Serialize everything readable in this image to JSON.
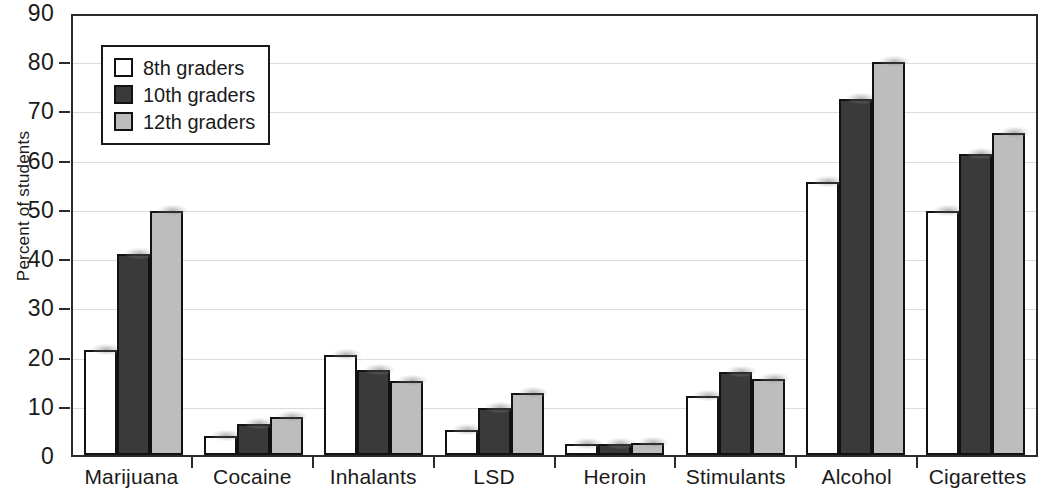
{
  "chart_data": {
    "type": "bar",
    "title": "",
    "subtitle": "",
    "xlabel": "",
    "ylabel": "Percent of students",
    "ylim": [
      0,
      90
    ],
    "ytick_step": 10,
    "yticks": [
      90,
      80,
      70,
      60,
      50,
      40,
      30,
      20,
      10,
      0
    ],
    "grid": true,
    "legend_position": "top-left",
    "categories": [
      "Marijuana",
      "Cocaine",
      "Inhalants",
      "LSD",
      "Heroin",
      "Stimulants",
      "Alcohol",
      "Cigarettes"
    ],
    "series": [
      {
        "name": "8th graders",
        "color": "#ffffff",
        "values": [
          21.5,
          3.8,
          20.5,
          5.2,
          2.2,
          12.0,
          56.0,
          50.0
        ]
      },
      {
        "name": "10th graders",
        "color": "#3a3a3a",
        "values": [
          41.2,
          6.4,
          17.5,
          9.6,
          2.3,
          17.0,
          73.0,
          61.7
        ]
      },
      {
        "name": "12th graders",
        "color": "#bdbdbd",
        "values": [
          50.0,
          7.8,
          15.2,
          12.7,
          2.4,
          15.5,
          80.5,
          66.0
        ]
      }
    ]
  },
  "legend": {
    "items": [
      {
        "label": "8th graders",
        "swatch": "white-square-icon"
      },
      {
        "label": "10th graders",
        "swatch": "dark-gray-square-icon"
      },
      {
        "label": "12th graders",
        "swatch": "light-gray-square-icon"
      }
    ]
  },
  "colors": {
    "series_8th": "#ffffff",
    "series_10th": "#3a3a3a",
    "series_12th": "#bdbdbd",
    "axis": "#2b2b2b",
    "gridline": "#dcdcdc",
    "text": "#1a1a1a",
    "background": "#ffffff"
  }
}
